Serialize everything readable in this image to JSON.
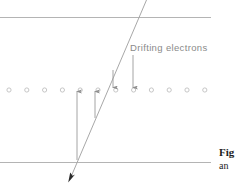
{
  "figure": {
    "background_color": "#ffffff",
    "line_color": "#b4b4b4",
    "arrow_color": "#9a9a9a",
    "track_color": "#a8a8a8",
    "circle_stroke": "#bdbdbd",
    "text_color": "#8a8a8a",
    "caption_color": "#1c1c1c",
    "labels": {
      "drifting_electrons": "Drifting electrons"
    },
    "caption": {
      "line1": "Fig",
      "line2": "an"
    },
    "boundaries": [
      {
        "name": "top-plane",
        "y": 17,
        "x1": 0,
        "x2": 211
      },
      {
        "name": "bottom-plane",
        "y": 162,
        "x1": 0,
        "x2": 211
      }
    ],
    "wire_row": {
      "y": 90,
      "count": 12,
      "start_x": 9,
      "spacing": 17.8,
      "radius": 2.1
    },
    "particle_track": {
      "x1": 146,
      "y1": 0,
      "x2": 69,
      "y2": 181,
      "arrowhead": "filled-down-left"
    },
    "drift_arrows": [
      {
        "name": "up-arrow-long",
        "direction": "up",
        "x": 77,
        "tail_y": 160,
        "head_y": 90
      },
      {
        "name": "up-arrow-short",
        "direction": "up",
        "x": 95,
        "tail_y": 118,
        "head_y": 90
      },
      {
        "name": "down-arrow-short",
        "direction": "down",
        "x": 113,
        "tail_y": 70,
        "head_y": 88
      },
      {
        "name": "down-arrow-long",
        "direction": "down",
        "x": 133,
        "tail_y": 55,
        "head_y": 88
      }
    ]
  }
}
